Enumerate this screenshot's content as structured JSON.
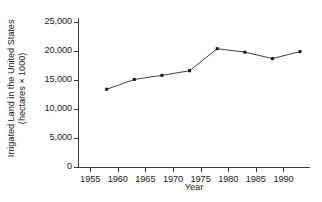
{
  "chart_data": {
    "type": "line",
    "title": "",
    "xlabel": "Year",
    "ylabel": "Irrigated Land in the United States (hectares × 1000)",
    "ylabel_line1": "Irrigated Land in the United States",
    "ylabel_line2": "(hectares × 1000)",
    "x": [
      1958,
      1963,
      1968,
      1973,
      1978,
      1983,
      1988,
      1993
    ],
    "values": [
      13400,
      15100,
      15800,
      16600,
      20400,
      19800,
      18700,
      19900
    ],
    "series": [
      {
        "name": "Irrigated Land",
        "values": [
          13400,
          15100,
          15800,
          16600,
          20400,
          19800,
          18700,
          19900
        ]
      }
    ],
    "xlim": [
      1952.8,
      1994.8
    ],
    "ylim": [
      0,
      25000
    ],
    "xticks": [
      1955,
      1960,
      1965,
      1970,
      1975,
      1980,
      1985,
      1990
    ],
    "xtick_labels": [
      "1955",
      "1960",
      "1965",
      "1970",
      "1975",
      "1980",
      "1985",
      "1990"
    ],
    "yticks": [
      0,
      5000,
      10000,
      15000,
      20000,
      25000
    ],
    "ytick_labels": [
      "0",
      "5,000",
      "10,000",
      "15,000",
      "20,000",
      "25,000"
    ],
    "grid": false,
    "legend": false,
    "legend_position": "none",
    "marker": "square",
    "line_color": "#2b2b2b",
    "marker_color": "#181818",
    "axis_color": "#3a3a3a",
    "background_color": "#ffffff"
  }
}
